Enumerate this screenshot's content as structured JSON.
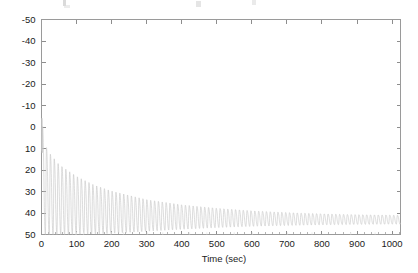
{
  "figure": {
    "background_color": "#ffffff",
    "frame_color": "#9a9a9a",
    "line_color": "#c6c6c6",
    "text_color": "#1b1b1b"
  },
  "axes": {
    "x_title": "Time (sec)",
    "y_title": "",
    "x_tick_labels": [
      "0",
      "100",
      "200",
      "300",
      "400",
      "500",
      "600",
      "700",
      "800",
      "900",
      "1000"
    ],
    "y_tick_labels": [
      "50",
      "40",
      "30",
      "20",
      "10",
      "0",
      "-10",
      "-20",
      "-30",
      "-40",
      "-50"
    ]
  },
  "chart_data": {
    "type": "line",
    "title": "",
    "xlabel": "Time (sec)",
    "ylabel": "",
    "xlim": [
      0,
      1024
    ],
    "ylim": [
      -50,
      50
    ],
    "xticks": [
      0,
      100,
      200,
      300,
      400,
      500,
      600,
      700,
      800,
      900,
      1000
    ],
    "yticks": [
      -50,
      -40,
      -30,
      -20,
      -10,
      0,
      10,
      20,
      30,
      40,
      50
    ],
    "grid": false,
    "legend": null,
    "legend_position": "none",
    "series": [
      {
        "name": "signal",
        "color": "#c6c6c6",
        "model": "damped_oscillation_with_drifting_mean",
        "oscillation_period_sec": 11.0,
        "n_cycles_visible": 93,
        "mean_level_start": -14.0,
        "mean_level_end": -43.5,
        "mean_decay_time_constant_sec": 190,
        "amplitude_start": 26.0,
        "amplitude_end": 3.0,
        "amplitude_decay_time_constant_sec": 210,
        "initial_peak_value": 4.0,
        "upper_envelope": [
          {
            "t": 0,
            "y": 4.0
          },
          {
            "t": 11,
            "y": -8.5
          },
          {
            "t": 22,
            "y": -12.0
          },
          {
            "t": 50,
            "y": -17.5
          },
          {
            "t": 100,
            "y": -23.0
          },
          {
            "t": 150,
            "y": -27.0
          },
          {
            "t": 200,
            "y": -29.8
          },
          {
            "t": 300,
            "y": -33.8
          },
          {
            "t": 400,
            "y": -36.2
          },
          {
            "t": 500,
            "y": -37.8
          },
          {
            "t": 600,
            "y": -39.0
          },
          {
            "t": 700,
            "y": -39.8
          },
          {
            "t": 800,
            "y": -40.4
          },
          {
            "t": 900,
            "y": -40.8
          },
          {
            "t": 1000,
            "y": -41.0
          },
          {
            "t": 1024,
            "y": -41.1
          }
        ],
        "lower_envelope": [
          {
            "t": 0,
            "y": -50.0
          },
          {
            "t": 50,
            "y": -50.0
          },
          {
            "t": 100,
            "y": -50.0
          },
          {
            "t": 200,
            "y": -49.5
          },
          {
            "t": 300,
            "y": -48.5
          },
          {
            "t": 400,
            "y": -47.6
          },
          {
            "t": 500,
            "y": -46.8
          },
          {
            "t": 600,
            "y": -46.2
          },
          {
            "t": 700,
            "y": -45.8
          },
          {
            "t": 800,
            "y": -45.5
          },
          {
            "t": 900,
            "y": -45.3
          },
          {
            "t": 1000,
            "y": -45.2
          },
          {
            "t": 1024,
            "y": -45.2
          }
        ]
      }
    ]
  }
}
